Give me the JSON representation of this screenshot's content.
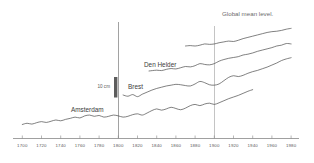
{
  "chart_data": {
    "type": "line",
    "title": "",
    "xlabel": "",
    "ylabel": "",
    "xlim": [
      1700,
      1980
    ],
    "ylim_note": "relative sea level, arbitrary offsets; vertical scale bar = 10 cm",
    "grid": false,
    "legend_position": "inline-labels",
    "xticks": [
      1700,
      1720,
      1740,
      1760,
      1780,
      1800,
      1820,
      1840,
      1860,
      1880,
      1900,
      1920,
      1940,
      1960,
      1980
    ],
    "xtick_labels": [
      "1700",
      "1720",
      "1740",
      "1760",
      "1780",
      "1800",
      "1820",
      "1840",
      "1860",
      "1880",
      "1900",
      "1920",
      "1940",
      "1960",
      "1980"
    ],
    "gridlines_vertical": [
      {
        "x": 1800,
        "style": "strong"
      },
      {
        "x": 1900,
        "style": "light"
      }
    ],
    "scale_bar": {
      "label": "10 cm",
      "at_year": 1793,
      "length_cm": 10
    },
    "annotations": [
      {
        "text": "Global mean level.",
        "at_year": 1920,
        "series": "global-mean-level"
      }
    ],
    "series": [
      {
        "name": "Amsterdam",
        "label": "Amsterdam",
        "label_at_year": 1755,
        "x": [
          1700,
          1705,
          1710,
          1715,
          1720,
          1725,
          1730,
          1735,
          1740,
          1745,
          1750,
          1755,
          1760,
          1765,
          1770,
          1775,
          1780,
          1785,
          1790,
          1795,
          1800,
          1805,
          1810,
          1815,
          1820,
          1825,
          1830,
          1835,
          1840,
          1845,
          1850,
          1855,
          1860,
          1865,
          1870,
          1875,
          1880,
          1885,
          1890,
          1895,
          1900,
          1905,
          1910,
          1915,
          1920,
          1925,
          1930,
          1935,
          1940
        ],
        "values": [
          0.0,
          0.6,
          0.2,
          0.9,
          1.4,
          1.0,
          1.6,
          2.2,
          1.8,
          2.5,
          3.0,
          3.6,
          3.2,
          4.2,
          4.6,
          4.0,
          4.4,
          3.6,
          4.0,
          4.6,
          4.2,
          3.6,
          4.0,
          4.8,
          5.2,
          4.6,
          5.6,
          6.8,
          7.6,
          7.0,
          7.6,
          8.4,
          7.8,
          7.2,
          8.0,
          9.2,
          9.8,
          9.2,
          10.0,
          10.4,
          9.8,
          10.6,
          11.6,
          12.6,
          13.4,
          14.2,
          15.2,
          16.2,
          17.0
        ]
      },
      {
        "name": "Brest",
        "label": "Brest",
        "label_at_year": 1838,
        "x": [
          1805,
          1810,
          1815,
          1820,
          1825,
          1830,
          1835,
          1840,
          1845,
          1850,
          1855,
          1860,
          1865,
          1870,
          1875,
          1880,
          1885,
          1890,
          1895,
          1900,
          1905,
          1910,
          1915,
          1920,
          1925,
          1930,
          1935,
          1940,
          1945,
          1950,
          1955,
          1960,
          1965,
          1970,
          1975,
          1980
        ],
        "values": [
          0.0,
          -0.6,
          0.2,
          -0.8,
          0.4,
          1.4,
          2.4,
          3.2,
          3.8,
          4.4,
          4.8,
          5.2,
          5.0,
          4.6,
          4.4,
          5.4,
          6.6,
          6.0,
          5.0,
          4.8,
          5.4,
          7.0,
          8.6,
          9.4,
          9.0,
          9.6,
          10.6,
          11.4,
          12.0,
          12.8,
          13.6,
          14.6,
          15.6,
          16.8,
          17.6,
          18.2
        ]
      },
      {
        "name": "Den Helder",
        "label": "Den Helder",
        "label_at_year": 1845,
        "x": [
          1832,
          1840,
          1845,
          1850,
          1855,
          1860,
          1865,
          1870,
          1875,
          1880,
          1885,
          1890,
          1895,
          1900,
          1905,
          1910,
          1915,
          1920,
          1925,
          1930,
          1935,
          1940,
          1945,
          1950,
          1955,
          1960,
          1965,
          1970,
          1975,
          1980
        ],
        "values": [
          0.0,
          0.4,
          0.2,
          0.8,
          1.2,
          1.0,
          1.6,
          2.2,
          2.0,
          2.6,
          3.6,
          3.2,
          3.0,
          3.6,
          4.8,
          5.6,
          6.2,
          6.6,
          7.0,
          7.8,
          8.2,
          8.8,
          9.6,
          10.2,
          10.8,
          11.4,
          12.2,
          12.6,
          13.4,
          13.2
        ]
      },
      {
        "name": "Global mean level",
        "label": "Global mean level.",
        "label_at_year": 1920,
        "x": [
          1870,
          1875,
          1880,
          1885,
          1890,
          1895,
          1900,
          1905,
          1910,
          1915,
          1920,
          1925,
          1930,
          1935,
          1940,
          1945,
          1950,
          1955,
          1960,
          1965,
          1970,
          1975,
          1980
        ],
        "values": [
          0.0,
          0.2,
          0.0,
          0.4,
          1.0,
          0.8,
          1.0,
          1.6,
          2.0,
          2.4,
          2.2,
          2.8,
          3.6,
          4.2,
          4.8,
          5.4,
          6.0,
          6.6,
          7.0,
          7.2,
          7.6,
          8.2,
          8.6
        ]
      }
    ]
  },
  "figure": {
    "scale_bar_label": "10 cm",
    "top_annotation": "Global mean level.",
    "labels": {
      "amsterdam": "Amsterdam",
      "brest": "Brest",
      "den_helder": "Den Helder"
    }
  }
}
